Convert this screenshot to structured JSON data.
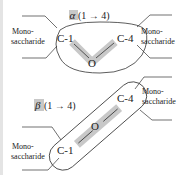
{
  "diagram": {
    "alpha_linkage": {
      "label_symbol": "α",
      "label_rest": "(1 → 4)",
      "left_carbon": "C-1",
      "right_carbon": "C-4",
      "oxygen": "O",
      "left_group": {
        "line1": "Mono-",
        "line2": "saccharide"
      },
      "right_group": {
        "line1": "Mono-",
        "line2": "saccharide"
      }
    },
    "beta_linkage": {
      "label_symbol": "β",
      "label_rest": "(1 → 4)",
      "left_carbon": "C-1",
      "right_carbon": "C-4",
      "oxygen": "O",
      "left_group": {
        "line1": "Mono-",
        "line2": "saccharide"
      },
      "right_group": {
        "line1": "Mono-",
        "line2": "saccharide"
      }
    },
    "colors": {
      "highlight": "#c8c8c8",
      "line": "#333333",
      "strip": "#e4e4e4"
    }
  }
}
